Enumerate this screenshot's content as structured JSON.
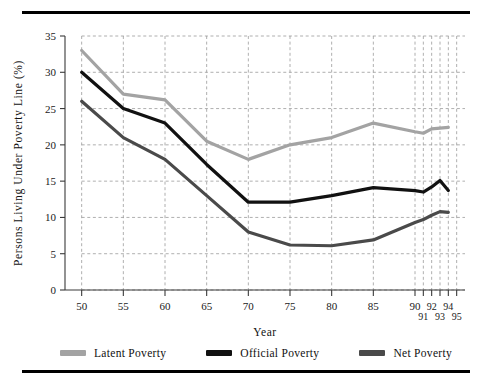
{
  "figure": {
    "top_rule": "",
    "bottom_rule": ""
  },
  "chart_data": {
    "type": "line",
    "title": "",
    "xlabel": "Year",
    "ylabel": "Persons Living Under Poverty Line (%)",
    "xlim": [
      48,
      96
    ],
    "ylim": [
      0,
      35
    ],
    "grid": true,
    "grid_style": "dashed",
    "legend_position": "bottom",
    "y_ticks": [
      0,
      5,
      10,
      15,
      20,
      25,
      30,
      35
    ],
    "y_tick_labels": [
      "0",
      "5",
      "10",
      "15",
      "20",
      "25",
      "30",
      "35"
    ],
    "x_ticks": [
      50,
      55,
      60,
      65,
      70,
      75,
      80,
      85,
      90,
      91,
      92,
      93,
      94,
      95
    ],
    "x_tick_labels": [
      "50",
      "55",
      "60",
      "65",
      "70",
      "75",
      "80",
      "85",
      "90",
      "91",
      "92",
      "93",
      "94",
      "95"
    ],
    "x_tick_label_rows": [
      0,
      0,
      0,
      0,
      0,
      0,
      0,
      0,
      0,
      1,
      0,
      1,
      0,
      1
    ],
    "x_gridlines": [
      50,
      55,
      60,
      65,
      70,
      75,
      80,
      85,
      90,
      91,
      92,
      93,
      94,
      95
    ],
    "x": [
      50,
      55,
      60,
      65,
      70,
      75,
      80,
      85,
      90,
      91,
      92,
      93,
      94,
      95
    ],
    "series": [
      {
        "name": "Latent Poverty",
        "color": "#a3a3a3",
        "values": [
          33.0,
          27.0,
          26.2,
          20.5,
          18.0,
          20.0,
          21.0,
          23.0,
          21.8,
          21.6,
          22.2,
          22.3,
          22.4,
          null
        ]
      },
      {
        "name": "Official Poverty",
        "color": "#111111",
        "values": [
          30.0,
          25.0,
          23.0,
          17.3,
          12.1,
          12.1,
          13.0,
          14.1,
          13.7,
          13.5,
          14.2,
          15.1,
          13.7,
          null
        ]
      },
      {
        "name": "Net Poverty",
        "color": "#4a4a4a",
        "values": [
          26.0,
          21.0,
          18.0,
          13.0,
          8.0,
          6.2,
          6.1,
          6.9,
          9.3,
          9.7,
          10.3,
          10.8,
          10.7,
          null
        ]
      }
    ]
  },
  "legend": {
    "items": [
      {
        "label": "Latent Poverty",
        "color": "#a3a3a3"
      },
      {
        "label": "Official Poverty",
        "color": "#111111"
      },
      {
        "label": "Net Poverty",
        "color": "#4a4a4a"
      }
    ]
  }
}
